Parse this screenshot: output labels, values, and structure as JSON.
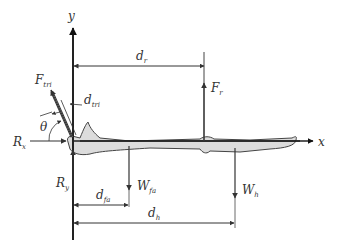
{
  "diagram": {
    "axes": {
      "x_label": "x",
      "y_label": "y"
    },
    "forces": {
      "triceps": {
        "symbol": "F",
        "subscript": "tri"
      },
      "radius_force": {
        "symbol": "F",
        "subscript": "r"
      },
      "reaction_x": {
        "symbol": "R",
        "subscript": "x"
      },
      "reaction_y": {
        "symbol": "R",
        "subscript": "y"
      },
      "forearm_weight": {
        "symbol": "W",
        "subscript": "fa"
      },
      "hand_weight": {
        "symbol": "W",
        "subscript": "h"
      }
    },
    "distances": {
      "triceps_arm": {
        "symbol": "d",
        "subscript": "tri"
      },
      "radius_arm": {
        "symbol": "d",
        "subscript": "r"
      },
      "forearm_arm": {
        "symbol": "d",
        "subscript": "fa"
      },
      "hand_arm": {
        "symbol": "d",
        "subscript": "h"
      }
    },
    "angle": {
      "symbol": "θ"
    },
    "colors": {
      "line": "#3a3a3a",
      "bone_fill": "#dcdcdc",
      "bone_stroke": "#444444",
      "text": "#333333"
    }
  }
}
